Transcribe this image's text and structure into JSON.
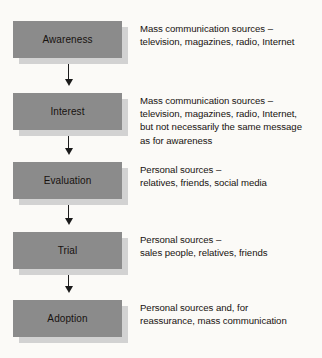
{
  "diagram": {
    "colors": {
      "box_fill": "#8b8b8b",
      "box_shadow": "#d2d2d2",
      "text": "#17120f",
      "arrow": "#1b1b1b",
      "background": "#fbfaf7"
    },
    "stages": [
      {
        "label": "Awareness",
        "description_lines": [
          "Mass communication sources –",
          "television, magazines, radio, Internet"
        ]
      },
      {
        "label": "Interest",
        "description_lines": [
          "Mass communication sources –",
          "television, magazines, radio, Internet,",
          "but not necessarily the same message",
          "as for awareness"
        ]
      },
      {
        "label": "Evaluation",
        "description_lines": [
          "Personal sources –",
          "relatives, friends, social media"
        ]
      },
      {
        "label": "Trial",
        "description_lines": [
          "Personal sources –",
          "sales people, relatives, friends"
        ]
      },
      {
        "label": "Adoption",
        "description_lines": [
          "Personal sources and, for",
          "reassurance, mass communication"
        ]
      }
    ],
    "connectors": [
      {
        "from": "Awareness",
        "to": "Interest",
        "icon": "down-arrow-icon"
      },
      {
        "from": "Interest",
        "to": "Evaluation",
        "icon": "down-arrow-icon"
      },
      {
        "from": "Evaluation",
        "to": "Trial",
        "icon": "down-arrow-icon"
      },
      {
        "from": "Trial",
        "to": "Adoption",
        "icon": "down-arrow-icon"
      }
    ]
  }
}
